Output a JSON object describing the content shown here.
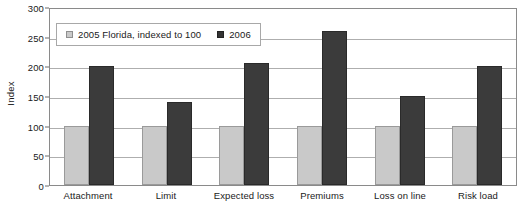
{
  "chart_data": {
    "type": "bar",
    "title": "",
    "xlabel": "",
    "ylabel": "Index",
    "ylim": [
      0,
      300
    ],
    "yticks": [
      0,
      50,
      100,
      150,
      200,
      250,
      300
    ],
    "grid": true,
    "legend_position": "top-left-inside",
    "categories": [
      "Attachment",
      "Limit",
      "Expected loss",
      "Premiums",
      "Loss on line",
      "Risk load"
    ],
    "series": [
      {
        "name": "2005 Florida, indexed to 100",
        "color": "#c9c9c9",
        "values": [
          100,
          100,
          100,
          100,
          100,
          100
        ]
      },
      {
        "name": "2006",
        "color": "#3b3b3b",
        "values": [
          200,
          140,
          205,
          260,
          150,
          200
        ]
      }
    ]
  },
  "legend": {
    "entries": [
      {
        "label": "2005 Florida, indexed to 100"
      },
      {
        "label": "2006"
      }
    ]
  }
}
